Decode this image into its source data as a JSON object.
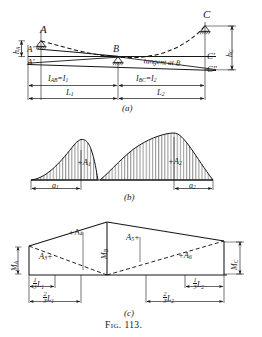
{
  "figure": {
    "caption": "Fig. 113.",
    "panels": [
      {
        "id": "a",
        "label": "(a)",
        "title": "continuous-beam elastic curve with tangent at B"
      },
      {
        "id": "b",
        "label": "(b)",
        "title": "simple-beam moment areas"
      },
      {
        "id": "c",
        "label": "(c)",
        "title": "end-moment trapezoid areas"
      }
    ]
  },
  "panel_a": {
    "label": "(a)",
    "points": {
      "A": "A",
      "A_prime": "A'",
      "A_dprime": "A′",
      "B": "B",
      "C": "C",
      "C_prime": "C'",
      "C_dprime": "C\""
    },
    "deflections": {
      "h_A": {
        "base": "h",
        "sub": "A"
      },
      "h_C": {
        "base": "h",
        "sub": "C"
      }
    },
    "tangent_note": "tangent at B",
    "inertia": [
      {
        "base": "I",
        "sub": "AB",
        "eq": "=",
        "base2": "I",
        "sub2": "1"
      },
      {
        "base": "I",
        "sub": "BC",
        "eq": "=",
        "base2": "I",
        "sub2": "2"
      }
    ],
    "spans": [
      {
        "base": "L",
        "sub": "1"
      },
      {
        "base": "L",
        "sub": "2"
      }
    ]
  },
  "panel_b": {
    "label": "(b)",
    "areas": [
      {
        "sign": "+",
        "base": "A",
        "sub": "1"
      },
      {
        "sign": "+",
        "base": "A",
        "sub": "2"
      }
    ],
    "centroid_dims": [
      {
        "base": "a",
        "sub": "1"
      },
      {
        "base": "a",
        "sub": "2"
      }
    ]
  },
  "panel_c": {
    "label": "(c)",
    "moments": [
      {
        "base": "M",
        "sub": "A"
      },
      {
        "base": "M",
        "sub": "B"
      },
      {
        "base": "M",
        "sub": "C"
      }
    ],
    "areas": [
      {
        "base": "A",
        "sub": "3",
        "sign": "+",
        "order": "after"
      },
      {
        "sign": "+",
        "base": "A",
        "sub": "4",
        "order": "before"
      },
      {
        "base": "A",
        "sub": "5",
        "sign": "+",
        "order": "after"
      },
      {
        "sign": "+",
        "base": "A",
        "sub": "6",
        "order": "before"
      }
    ],
    "centroid_dims": [
      {
        "num": "1",
        "den": "3",
        "base": "L",
        "sub": "1"
      },
      {
        "num": "2",
        "den": "3",
        "base": "L",
        "sub": "1"
      },
      {
        "num": "1",
        "den": "3",
        "base": "L",
        "sub": "2"
      },
      {
        "num": "2",
        "den": "3",
        "base": "L",
        "sub": "2"
      }
    ]
  },
  "colors": {
    "ink": "#161616",
    "paper": "#ffffff"
  }
}
